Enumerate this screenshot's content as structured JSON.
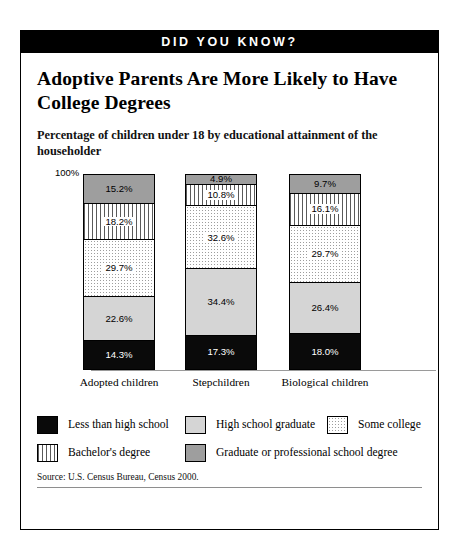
{
  "banner": {
    "label": "DID YOU KNOW?"
  },
  "headline": "Adoptive Parents Are More Likely to Have College Degrees",
  "subhead": "Percentage of children under 18 by educational attainment of the householder",
  "source": "Source: U.S. Census Bureau, Census 2000.",
  "axis": {
    "top_label": "100%"
  },
  "legend": {
    "items": [
      {
        "label": "Less than high school",
        "fill": "black"
      },
      {
        "label": "High school graduate",
        "fill": "light-gray"
      },
      {
        "label": "Some college",
        "fill": "dotted"
      },
      {
        "label": "Bachelor's degree",
        "fill": "vertical-stripe"
      },
      {
        "label": "Graduate or professional school degree",
        "fill": "medium-gray"
      }
    ]
  },
  "chart_data": {
    "type": "bar",
    "subtype": "stacked-100-percent",
    "title": "Adoptive Parents Are More Likely to Have College Degrees",
    "subtitle": "Percentage of children under 18 by educational attainment of the householder",
    "xlabel": "",
    "ylabel": "",
    "ylim": [
      0,
      100
    ],
    "grid": false,
    "legend_position": "bottom",
    "categories": [
      "Adopted children",
      "Stepchildren",
      "Biological children"
    ],
    "series": [
      {
        "name": "Less than high school",
        "values": [
          14.3,
          17.3,
          18.0
        ],
        "labels": [
          "14.3%",
          "17.3%",
          "18.0%"
        ],
        "fill": "black"
      },
      {
        "name": "High school graduate",
        "values": [
          22.6,
          34.4,
          26.4
        ],
        "labels": [
          "22.6%",
          "34.4%",
          "26.4%"
        ],
        "fill": "light-gray"
      },
      {
        "name": "Some college",
        "values": [
          29.7,
          32.6,
          29.7
        ],
        "labels": [
          "29.7%",
          "32.6%",
          "29.7%"
        ],
        "fill": "dotted"
      },
      {
        "name": "Bachelor's degree",
        "values": [
          18.2,
          10.8,
          16.1
        ],
        "labels": [
          "18.2%",
          "10.8%",
          "16.1%"
        ],
        "fill": "vertical-stripe"
      },
      {
        "name": "Graduate or professional school degree",
        "values": [
          15.2,
          4.9,
          9.7
        ],
        "labels": [
          "15.2%",
          "4.9%",
          "9.7%"
        ],
        "fill": "medium-gray"
      }
    ]
  }
}
